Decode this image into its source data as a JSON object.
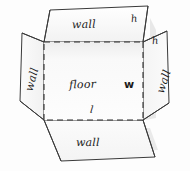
{
  "figure": {
    "colors": {
      "outline": "#3a3a3a",
      "fold_line": "#2e2e2e",
      "face_fill": "#fbfbfb",
      "floor_fill": "#fafafa",
      "shadow": "#d8d8d8",
      "background": "#fdfdfd",
      "text": "#1b1b1b"
    },
    "faces": {
      "floor": {
        "label": "floor"
      },
      "wall_top": {
        "label": "wall"
      },
      "wall_bottom": {
        "label": "wall"
      },
      "wall_left": {
        "label": "wall"
      },
      "wall_right": {
        "label": "wall"
      }
    },
    "dimensions": {
      "length": "l",
      "width": "w",
      "height_top": "h",
      "height_right": "h"
    }
  }
}
